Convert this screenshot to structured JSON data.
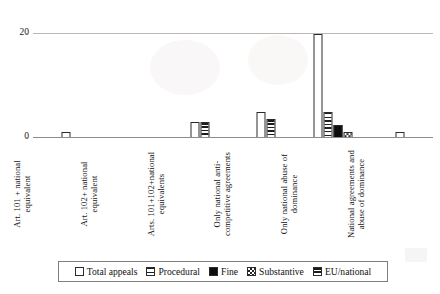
{
  "chart_data": {
    "type": "bar",
    "title": "",
    "subtitle": "",
    "xlabel": "",
    "ylabel": "",
    "ylim": [
      0,
      20
    ],
    "yticks": [
      "0",
      "20"
    ],
    "grid": "horizontal-top-only",
    "legend_position": "bottom",
    "categories": [
      "Art. 101 + national\nequivalent",
      "Art. 102+ national\nequivalent",
      "Arts. 101+102+national\nequivalents",
      "Only national anti-\ncompetitive agreements",
      "Only national abuse of\ndominance",
      "National agreements and\nabuse of dominance"
    ],
    "series": [
      {
        "name": "Total appeals",
        "pattern": "dotted",
        "values": [
          1,
          0,
          3,
          5,
          20,
          1
        ]
      },
      {
        "name": "Procedural",
        "pattern": "horizontal-lines",
        "values": [
          0,
          0,
          0,
          0,
          5,
          0
        ]
      },
      {
        "name": "Fine",
        "pattern": "solid-black",
        "values": [
          0,
          0,
          0,
          0,
          2.5,
          0
        ]
      },
      {
        "name": "Substantive",
        "pattern": "checkered",
        "values": [
          0,
          0,
          0,
          0,
          1,
          0
        ]
      },
      {
        "name": "EU/national",
        "pattern": "dense-horizontal",
        "values": [
          0,
          0,
          3,
          3.5,
          0,
          0
        ]
      }
    ]
  },
  "axis": {
    "y_top_label": "20",
    "y_zero_label": "0"
  },
  "legend": {
    "items": [
      {
        "label": "Total appeals",
        "pattern": "dotted"
      },
      {
        "label": "Procedural",
        "pattern": "horizontal-lines"
      },
      {
        "label": "Fine",
        "pattern": "solid-black"
      },
      {
        "label": "Substantive",
        "pattern": "checkered"
      },
      {
        "label": "EU/national",
        "pattern": "dense-horizontal"
      }
    ]
  },
  "colors": {
    "axis": "#8c8c8c",
    "gridline": "#b9b9b9",
    "bar_outline": "#2b2b2b",
    "text": "#141414",
    "background": "#ffffff"
  }
}
